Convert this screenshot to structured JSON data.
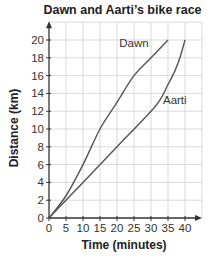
{
  "chart_data": {
    "type": "line",
    "title": "Dawn and Aarti’s bike race",
    "xlabel": "Time (minutes)",
    "ylabel": "Distance (km)",
    "xlim": [
      0,
      45
    ],
    "ylim": [
      0,
      22
    ],
    "x_ticks": [
      0,
      5,
      10,
      15,
      20,
      25,
      30,
      35,
      40
    ],
    "y_ticks": [
      0,
      2,
      4,
      6,
      8,
      10,
      12,
      14,
      16,
      18,
      20
    ],
    "grid": true,
    "legend": "inline labels",
    "series": [
      {
        "name": "Dawn",
        "x": [
          0,
          5,
          10,
          15,
          20,
          25,
          30,
          35
        ],
        "values": [
          0,
          2.5,
          6,
          10,
          13,
          16,
          18,
          20
        ],
        "label_position": [
          25,
          19.2
        ]
      },
      {
        "name": "Aarti",
        "x": [
          0,
          10,
          20,
          30,
          33,
          35,
          37,
          38.5,
          40
        ],
        "values": [
          0,
          4,
          8,
          12,
          13.5,
          15,
          16.5,
          18,
          20
        ],
        "label_position": [
          37,
          12.8
        ]
      }
    ]
  },
  "colors": {
    "line": "#555555",
    "grid": "#d9d9d9",
    "axis": "#333333",
    "text": "#222222"
  }
}
